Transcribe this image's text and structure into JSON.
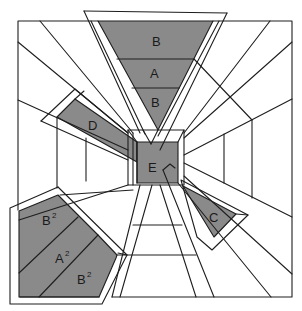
{
  "diagram": {
    "type": "perspective room panel diagram",
    "colors": {
      "panel_fill": "#8a8a8a",
      "line": "#1e1e1e",
      "background": "#ffffff"
    },
    "labels": {
      "top_b1": "B",
      "top_a": "A",
      "top_b2": "B",
      "left_d": "D",
      "center_e": "E",
      "right_c": "C",
      "bottom_b2_upper": "B",
      "bottom_a2": "A",
      "bottom_b2_lower": "B",
      "superscript": "2"
    }
  }
}
